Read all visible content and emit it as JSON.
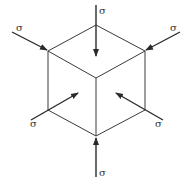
{
  "diagram": {
    "title": "",
    "colors": {
      "line": "#3a3a3a",
      "arrow": "#2a2a2a",
      "text": "#333333",
      "background": "#ffffff"
    },
    "cube": {
      "vertices": {
        "top": [
          96,
          25
        ],
        "upper_left": [
          48,
          51
        ],
        "upper_right": [
          145,
          51
        ],
        "center": [
          96,
          78
        ],
        "lower_left": [
          48,
          110
        ],
        "lower_right": [
          145,
          110
        ],
        "bottom": [
          96,
          136
        ]
      }
    },
    "arrows": [
      {
        "id": "top",
        "from": [
          96,
          5
        ],
        "to": [
          96,
          56
        ],
        "label": "σ",
        "label_pos": [
          99,
          14
        ]
      },
      {
        "id": "upper-left",
        "from": [
          12,
          32
        ],
        "to": [
          47,
          50
        ],
        "label": "σ",
        "label_pos": [
          16,
          31
        ]
      },
      {
        "id": "upper-right",
        "from": [
          180,
          32
        ],
        "to": [
          146,
          50
        ],
        "label": "σ",
        "label_pos": [
          170,
          31
        ]
      },
      {
        "id": "lower-left",
        "from": [
          31,
          120
        ],
        "to": [
          78,
          93
        ],
        "label": "σ",
        "label_pos": [
          30,
          127
        ]
      },
      {
        "id": "lower-right",
        "from": [
          163,
          120
        ],
        "to": [
          116,
          93
        ],
        "label": "σ",
        "label_pos": [
          155,
          127
        ]
      },
      {
        "id": "bottom",
        "from": [
          96,
          177
        ],
        "to": [
          96,
          138
        ],
        "label": "σ",
        "label_pos": [
          99,
          176
        ]
      }
    ],
    "labels": [
      "σ",
      "σ",
      "σ",
      "σ",
      "σ",
      "σ"
    ]
  }
}
